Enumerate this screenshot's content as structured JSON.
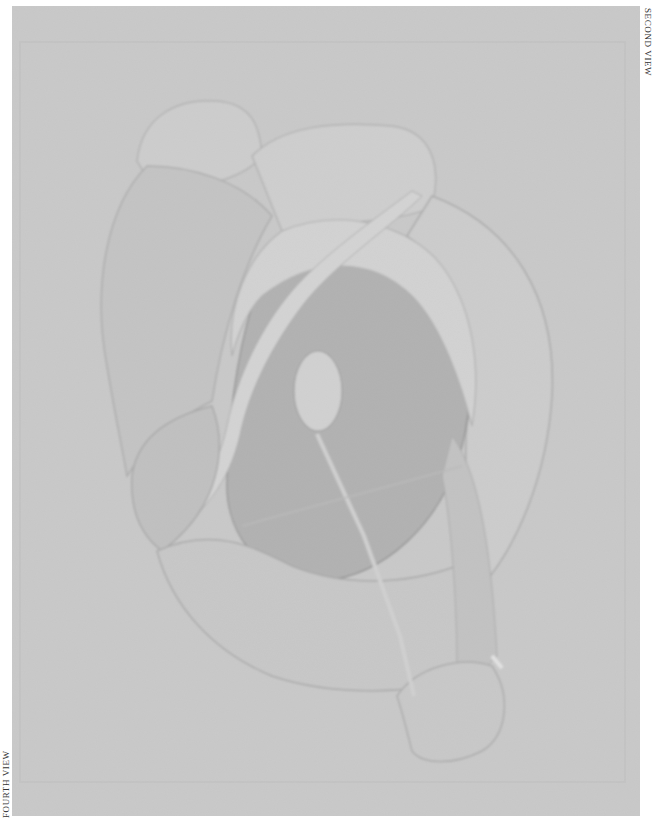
{
  "plate": {
    "description": "Grayscale reproduction of an abstract rounded sculptural form",
    "colors": {
      "background": "#c9c9c9",
      "light_form": "#d4d4d4",
      "mid_form": "#b9b9b9",
      "dark_disc": "#a3a3a3",
      "highlight": "#dcdcdc",
      "outline": "#8f8f8f"
    }
  },
  "captions": {
    "right": "SECOND VIEW",
    "left": "FOURTH VIEW"
  }
}
